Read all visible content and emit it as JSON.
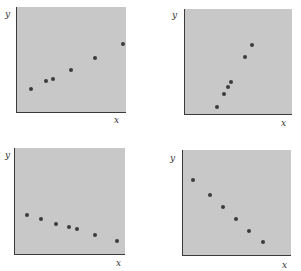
{
  "chart_data": [
    {
      "type": "scatter",
      "title": "",
      "xlabel": "x",
      "ylabel": "y",
      "grid": false,
      "description": "Positive linear trend, moderate slope",
      "points": [
        [
          0.13,
          0.23
        ],
        [
          0.26,
          0.3
        ],
        [
          0.33,
          0.32
        ],
        [
          0.49,
          0.41
        ],
        [
          0.71,
          0.52
        ],
        [
          0.96,
          0.65
        ]
      ],
      "box": {
        "left": 16,
        "top": 7,
        "width": 110,
        "height": 106
      },
      "x_label_pos": [
        114,
        116
      ],
      "y_label_pos": [
        5,
        10
      ]
    },
    {
      "type": "scatter",
      "title": "",
      "xlabel": "x",
      "ylabel": "y",
      "grid": false,
      "description": "Strong positive linear trend, steep slope",
      "points": [
        [
          0.3,
          0.08
        ],
        [
          0.36,
          0.2
        ],
        [
          0.4,
          0.26
        ],
        [
          0.43,
          0.31
        ],
        [
          0.56,
          0.55
        ],
        [
          0.62,
          0.66
        ]
      ],
      "box": {
        "left": 184,
        "top": 9,
        "width": 108,
        "height": 106
      },
      "x_label_pos": [
        281,
        119
      ],
      "y_label_pos": [
        172,
        11
      ]
    },
    {
      "type": "scatter",
      "title": "",
      "xlabel": "x",
      "ylabel": "y",
      "grid": false,
      "description": "Weak negative linear trend, shallow slope",
      "points": [
        [
          0.11,
          0.37
        ],
        [
          0.23,
          0.34
        ],
        [
          0.37,
          0.29
        ],
        [
          0.49,
          0.26
        ],
        [
          0.56,
          0.24
        ],
        [
          0.72,
          0.19
        ],
        [
          0.92,
          0.13
        ]
      ],
      "box": {
        "left": 14,
        "top": 148,
        "width": 111,
        "height": 107
      },
      "x_label_pos": [
        116,
        259
      ],
      "y_label_pos": [
        5,
        151
      ]
    },
    {
      "type": "scatter",
      "title": "",
      "xlabel": "x",
      "ylabel": "y",
      "grid": false,
      "description": "Strong negative linear trend",
      "points": [
        [
          0.09,
          0.72
        ],
        [
          0.25,
          0.58
        ],
        [
          0.37,
          0.46
        ],
        [
          0.49,
          0.35
        ],
        [
          0.61,
          0.24
        ],
        [
          0.73,
          0.13
        ]
      ],
      "box": {
        "left": 182,
        "top": 150,
        "width": 109,
        "height": 106
      },
      "x_label_pos": [
        282,
        261
      ],
      "y_label_pos": [
        170,
        154
      ]
    }
  ],
  "labels": {
    "x": "x",
    "y": "y"
  },
  "colors": {
    "plot_background": "#c8c8c8",
    "point": "#3c3c3c",
    "axis": "#3a3a3a"
  }
}
